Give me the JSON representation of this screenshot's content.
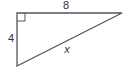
{
  "diagram": {
    "type": "right-triangle",
    "labels": {
      "top_side": "8",
      "left_side": "4",
      "hypotenuse": "x"
    },
    "vertices": {
      "right_angle": [
        17,
        13
      ],
      "top_right": [
        122,
        13
      ],
      "bottom_left": [
        17,
        66
      ]
    },
    "right_angle_marker": true,
    "colors": {
      "stroke": "#555555",
      "text": "#333333",
      "background": "#ffffff"
    }
  }
}
